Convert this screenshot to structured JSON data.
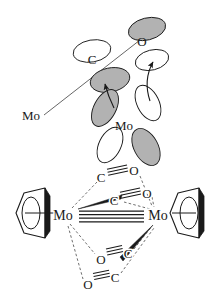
{
  "figure": {
    "title": "",
    "panels": [
      {
        "id": "orbital-overlap-panel",
        "name": "orbital-interaction-diagram",
        "description": "Orbital lobe (p-orbital) interaction diagram showing back-donation arrows from Mo to CO ligand",
        "labels": [
          {
            "id": "label-c-upper",
            "text": "C",
            "x": 92,
            "y": 64
          },
          {
            "id": "label-o-upper",
            "text": "O",
            "x": 142,
            "y": 46
          },
          {
            "id": "label-mo-left",
            "text": "Mo",
            "x": 22,
            "y": 120
          },
          {
            "id": "label-mo-center",
            "text": "Mo",
            "x": 124,
            "y": 130
          }
        ],
        "lobes": [
          {
            "id": "lobe-c-upper-left",
            "fill": "white",
            "cx": 92,
            "cy": 51,
            "rx": 19,
            "ry": 11,
            "rot": -10
          },
          {
            "id": "lobe-c-lower-right",
            "fill": "gray",
            "cx": 110,
            "cy": 80,
            "rx": 20,
            "ry": 12,
            "rot": -12
          },
          {
            "id": "lobe-o-upper-right",
            "fill": "gray",
            "cx": 147,
            "cy": 29,
            "rx": 19,
            "ry": 11,
            "rot": -14
          },
          {
            "id": "lobe-o-lower-left",
            "fill": "white",
            "cx": 152,
            "cy": 60,
            "rx": 17,
            "ry": 10,
            "rot": -14
          },
          {
            "id": "lobe-mo-upper-left",
            "fill": "gray",
            "cx": 105,
            "cy": 108,
            "rx": 11,
            "ry": 20,
            "rot": 28
          },
          {
            "id": "lobe-mo-upper-right",
            "fill": "white",
            "cx": 148,
            "cy": 103,
            "rx": 11,
            "ry": 19,
            "rot": -26
          },
          {
            "id": "lobe-mo-lower-left",
            "fill": "white",
            "cx": 110,
            "cy": 145,
            "rx": 11,
            "ry": 19,
            "rot": 26
          },
          {
            "id": "lobe-mo-lower-right",
            "fill": "gray",
            "cx": 146,
            "cy": 147,
            "rx": 12,
            "ry": 20,
            "rot": -28
          }
        ],
        "bonds": [
          {
            "id": "bond-mo-left-to-c",
            "x1": 44,
            "y1": 115,
            "x2": 140,
            "y2": 40
          }
        ],
        "arrows": [
          {
            "id": "arrow-backdonation-left",
            "from": [
              112,
              104
            ],
            "to": [
              104,
              80
            ]
          },
          {
            "id": "arrow-backdonation-right",
            "from": [
              150,
              101
            ],
            "to": [
              154,
              58
            ]
          }
        ]
      },
      {
        "id": "structure-panel",
        "name": "cp2mo2-co4-structure",
        "description": "Cp2Mo2(CO)4 structure with Mo-Mo quadruple bond and four carbonyl ligands",
        "metal_left": {
          "id": "metal-left",
          "text": "Mo",
          "x": 63,
          "y": 216
        },
        "metal_right": {
          "id": "metal-right",
          "text": "Mo",
          "x": 158,
          "y": 216
        },
        "bond_order_lines": 4,
        "carbonyls": [
          {
            "id": "co-top-outer",
            "c": {
              "text": "C",
              "x": 101,
              "y": 177
            },
            "o": {
              "text": "O",
              "x": 134,
              "y": 170
            },
            "bond": "triple",
            "wedge": false
          },
          {
            "id": "co-top-inner",
            "c": {
              "text": "C",
              "x": 114,
              "y": 200
            },
            "o": {
              "text": "O",
              "x": 147,
              "y": 193
            },
            "bond": "triple",
            "wedge": true
          },
          {
            "id": "co-bottom-inner",
            "c": {
              "text": "C",
              "x": 128,
              "y": 253
            },
            "o": {
              "text": "O",
              "x": 101,
              "y": 259
            },
            "bond": "triple",
            "wedge": true
          },
          {
            "id": "co-bottom-outer",
            "c": {
              "text": "C",
              "x": 115,
              "y": 277
            },
            "o": {
              "text": "O",
              "x": 88,
              "y": 284
            },
            "bond": "triple",
            "wedge": false
          }
        ],
        "cp_rings": [
          {
            "id": "cp-ring-left",
            "side": "left",
            "cx": 37,
            "cy": 216
          },
          {
            "id": "cp-ring-right",
            "side": "right",
            "cx": 185,
            "cy": 216
          }
        ]
      }
    ]
  },
  "style": {
    "line_color": "#1a1a1a",
    "dashed_color": "#555555",
    "lobe_shaded_fill": "#b2b2b2",
    "lobe_empty_fill": "#ffffff",
    "background": "#ffffff"
  }
}
